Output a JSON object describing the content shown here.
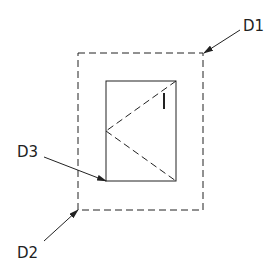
{
  "diagram": {
    "labels": {
      "d1": "D1",
      "d2": "D2",
      "d3": "D3"
    },
    "colors": {
      "stroke": "#222222",
      "background": "#ffffff"
    },
    "elements": {
      "outer_frame": {
        "style": "dashed",
        "x": 78,
        "y": 53,
        "width": 125,
        "height": 157
      },
      "inner_frame": {
        "style": "solid",
        "x": 106,
        "y": 81,
        "width": 70,
        "height": 100
      },
      "hinge_lines": {
        "style": "dashed",
        "apex": [
          106,
          131
        ],
        "ends": [
          [
            176,
            81
          ],
          [
            176,
            181
          ]
        ]
      },
      "handle_mark": {
        "x": 164,
        "y1": 93,
        "y2": 109
      }
    }
  }
}
